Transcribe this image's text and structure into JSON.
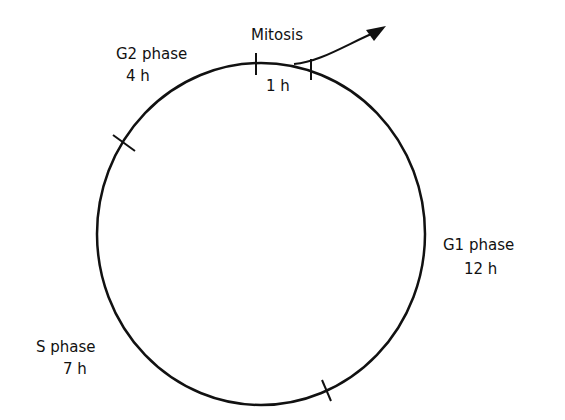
{
  "diagram": {
    "type": "cell-cycle",
    "phases": [
      {
        "name": "Mitosis",
        "duration": "1 h"
      },
      {
        "name": "G1 phase",
        "duration": "12 h"
      },
      {
        "name": "S phase",
        "duration": "7 h"
      },
      {
        "name": "G2 phase",
        "duration": "4 h"
      }
    ],
    "labels": {
      "mitosis": "Mitosis",
      "mitosis_time": "1 h",
      "g1": "G1 phase",
      "g1_time": "12 h",
      "s": "S phase",
      "s_time": "7 h",
      "g2": "G2 phase",
      "g2_time": "4 h"
    },
    "colors": {
      "line": "#111111",
      "background": "#ffffff"
    }
  }
}
